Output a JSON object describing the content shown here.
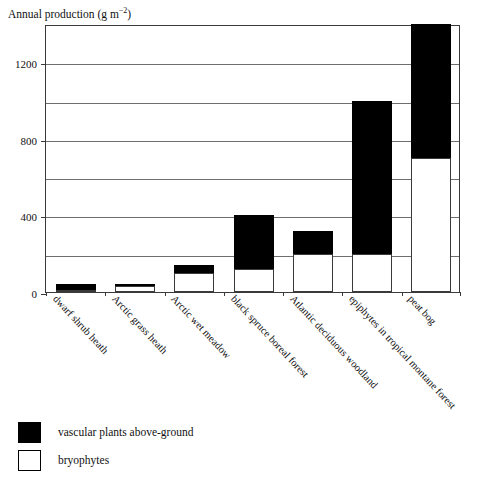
{
  "chart_data": {
    "type": "bar",
    "stacked": true,
    "title": "Annual production (g m−2)",
    "title_main": "Annual production (g m",
    "title_sup": "−2",
    "title_close": ")",
    "xlabel": "",
    "ylabel": "Annual production (g m−2)",
    "ylim": [
      0,
      1400
    ],
    "ytick_labels": [
      "0",
      "400",
      "800",
      "1200"
    ],
    "ytick_values": [
      0,
      400,
      800,
      1200
    ],
    "gridline_values": [
      200,
      400,
      600,
      800,
      1000,
      1200,
      1400
    ],
    "grid": true,
    "legend_position": "below-plot-left",
    "categories": [
      "dwarf shrub heath",
      "Arctic grass heath",
      "Arctic wet meadow",
      "black spruce boreal forest",
      "Atlantic deciduous woodland",
      "epiphytes in tropical montane forest",
      "peat bog"
    ],
    "series": [
      {
        "name": "bryophytes",
        "color": "#ffffff",
        "values": [
          10,
          30,
          100,
          120,
          200,
          200,
          700
        ]
      },
      {
        "name": "vascular plants above-ground",
        "color": "#000000",
        "values": [
          30,
          10,
          40,
          280,
          120,
          800,
          700
        ]
      }
    ],
    "totals": [
      40,
      40,
      140,
      400,
      320,
      1000,
      1400
    ]
  },
  "legend": {
    "items": [
      {
        "label": "vascular plants above-ground",
        "swatch": "filled"
      },
      {
        "label": "bryophytes",
        "swatch": "hollow"
      }
    ]
  },
  "colors": {
    "vascular": "#000000",
    "bryophytes": "#ffffff",
    "axis": "#3a3a3a",
    "gridline": "#6e6e6e",
    "text": "#111111",
    "background": "#ffffff"
  }
}
